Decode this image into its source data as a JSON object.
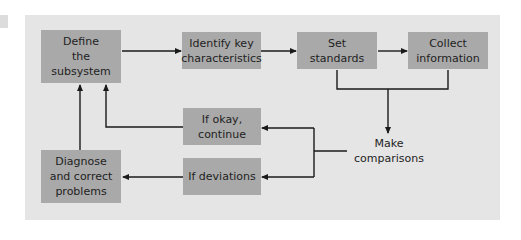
{
  "diagram": {
    "type": "flowchart",
    "colors": {
      "background": "#ffffff",
      "panel": "#e5e5e5",
      "box_fill": "#a9a9a9",
      "text": "#1e1e1e",
      "connector": "#1a1a1a"
    },
    "nodes": {
      "define": "Define the subsystem",
      "identify": "Identify key characteristics",
      "set_standards": "Set standards",
      "collect": "Collect information",
      "compare": "Make comparisons",
      "okay": "If okay, continue",
      "deviations": "If deviations",
      "diagnose": "Diagnose and correct problems"
    },
    "lines": {
      "define": [
        "Define",
        "the",
        "subsystem"
      ],
      "identify": [
        "Identify key",
        "characteristics"
      ],
      "set_standards": [
        "Set",
        "standards"
      ],
      "collect": [
        "Collect",
        "information"
      ],
      "compare": [
        "Make",
        "comparisons"
      ],
      "okay": [
        "If okay,",
        "continue"
      ],
      "deviations": [
        "If deviations"
      ],
      "diagnose": [
        "Diagnose",
        "and correct",
        "problems"
      ]
    },
    "edges": [
      {
        "from": "Define the subsystem",
        "to": "Identify key characteristics"
      },
      {
        "from": "Identify key characteristics",
        "to": "Set standards"
      },
      {
        "from": "Set standards",
        "to": "Collect information"
      },
      {
        "from": "Set standards",
        "to": "Make comparisons"
      },
      {
        "from": "Collect information",
        "to": "Make comparisons"
      },
      {
        "from": "Make comparisons",
        "to": "If okay, continue"
      },
      {
        "from": "Make comparisons",
        "to": "If deviations"
      },
      {
        "from": "If okay, continue",
        "to": "Define the subsystem"
      },
      {
        "from": "If deviations",
        "to": "Diagnose and correct problems"
      },
      {
        "from": "Diagnose and correct problems",
        "to": "Define the subsystem"
      }
    ]
  }
}
